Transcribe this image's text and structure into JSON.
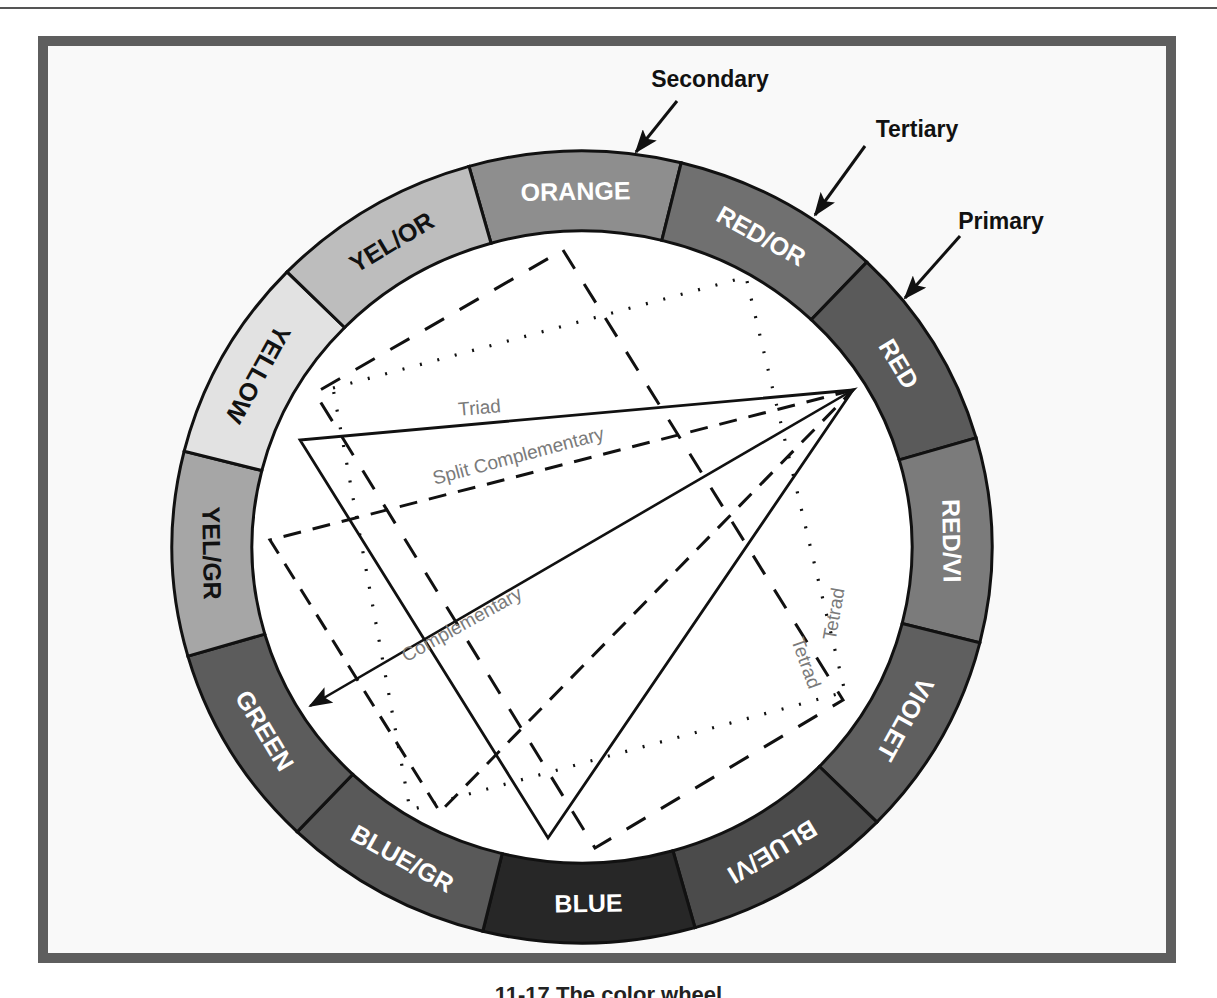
{
  "figure": {
    "caption": "11-17 The color wheel"
  },
  "wheel": {
    "center": [
      582,
      547
    ],
    "outer_radius": [
      410,
      396
    ],
    "inner_radius": [
      330,
      316
    ],
    "start_angle_deg": -16,
    "segments": [
      {
        "label": "ORANGE",
        "fill": "#8e8e8e",
        "text": "#ffffff",
        "flip": false
      },
      {
        "label": "RED/OR",
        "fill": "#707070",
        "text": "#ffffff",
        "flip": false
      },
      {
        "label": "RED",
        "fill": "#5a5a5a",
        "text": "#ffffff",
        "flip": false
      },
      {
        "label": "RED/VI",
        "fill": "#7b7b7b",
        "text": "#ffffff",
        "flip": false
      },
      {
        "label": "VIOLET",
        "fill": "#5f5f5f",
        "text": "#ffffff",
        "flip": false
      },
      {
        "label": "BLUE/VI",
        "fill": "#4b4b4b",
        "text": "#ffffff",
        "flip": false
      },
      {
        "label": "BLUE",
        "fill": "#272727",
        "text": "#ffffff",
        "flip": true
      },
      {
        "label": "BLUE/GR",
        "fill": "#595959",
        "text": "#ffffff",
        "flip": true
      },
      {
        "label": "GREEN",
        "fill": "#5c5c5c",
        "text": "#ffffff",
        "flip": true
      },
      {
        "label": "YEL/GR",
        "fill": "#a6a6a6",
        "text": "#111111",
        "flip": true
      },
      {
        "label": "YELLOW",
        "fill": "#e2e2e2",
        "text": "#111111",
        "flip": true
      },
      {
        "label": "YEL/OR",
        "fill": "#bdbdbd",
        "text": "#111111",
        "flip": false
      }
    ]
  },
  "callouts": [
    {
      "label": "Secondary",
      "text_pos": [
        710,
        87
      ],
      "arrow_from": [
        677,
        101
      ],
      "arrow_to": [
        636,
        152
      ]
    },
    {
      "label": "Tertiary",
      "text_pos": [
        917,
        137
      ],
      "arrow_from": [
        865,
        146
      ],
      "arrow_to": [
        815,
        215
      ]
    },
    {
      "label": "Primary",
      "text_pos": [
        1001,
        229
      ],
      "arrow_from": [
        960,
        236
      ],
      "arrow_to": [
        905,
        298
      ]
    }
  ],
  "harmonies": {
    "triad": {
      "label": "Triad",
      "points": [
        [
          853,
          390
        ],
        [
          300,
          440
        ],
        [
          548,
          838
        ]
      ],
      "label_pos": [
        480,
        414
      ],
      "label_rot": -5
    },
    "split_complementary": {
      "label": "Split Complementary",
      "points": [
        [
          853,
          390
        ],
        [
          270,
          540
        ],
        [
          440,
          812
        ]
      ],
      "label_pos": [
        520,
        462
      ],
      "label_rot": -15
    },
    "complementary": {
      "label": "Complementary",
      "from": [
        853,
        390
      ],
      "to": [
        310,
        706
      ],
      "label_pos": [
        465,
        630
      ],
      "label_rot": -29
    },
    "tetrad_dashed": {
      "label": "Tetrad",
      "points": [
        [
          563,
          250
        ],
        [
          843,
          700
        ],
        [
          595,
          848
        ],
        [
          315,
          393
        ]
      ],
      "label_pos": [
        800,
        665
      ],
      "label_rot": 70
    },
    "tetrad_dotted": {
      "label": "Tetrad",
      "points": [
        [
          333,
          388
        ],
        [
          746,
          277
        ],
        [
          845,
          692
        ],
        [
          410,
          810
        ]
      ],
      "label_pos": [
        840,
        615
      ],
      "label_rot": -80
    }
  }
}
